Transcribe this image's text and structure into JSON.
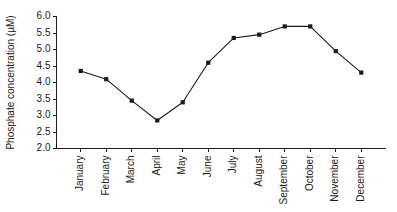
{
  "chart_data": {
    "type": "line",
    "title": "",
    "subtitle": "",
    "xlabel": "",
    "ylabel": "Phosphate concentration (µM)",
    "categories": [
      "January",
      "February",
      "March",
      "April",
      "May",
      "June",
      "July",
      "August",
      "September",
      "October",
      "November",
      "December"
    ],
    "values": [
      4.35,
      4.1,
      3.45,
      2.85,
      3.4,
      4.6,
      5.35,
      5.45,
      5.7,
      5.7,
      4.95,
      4.3
    ],
    "series": [
      {
        "name": "Phosphate concentration",
        "values": [
          4.35,
          4.1,
          3.45,
          2.85,
          3.4,
          4.6,
          5.35,
          5.45,
          5.7,
          5.7,
          4.95,
          4.3
        ]
      }
    ],
    "ylim": [
      2.0,
      6.0
    ],
    "ytick_labels": [
      "2.0",
      "2.5",
      "3.0",
      "3.5",
      "4.0",
      "4.5",
      "5.0",
      "5.5",
      "6.0"
    ],
    "ytick_values": [
      2.0,
      2.5,
      3.0,
      3.5,
      4.0,
      4.5,
      5.0,
      5.5,
      6.0
    ],
    "grid": false,
    "legend": false,
    "legend_position": "none",
    "marker": "square",
    "line_color": "#1a1a1a",
    "marker_color": "#1a1a1a",
    "background_color": "#ffffff",
    "xtick_label_rotation": 90,
    "annotations": []
  },
  "axes": {
    "y_axis_name": "y-axis",
    "x_axis_name": "x-axis"
  }
}
